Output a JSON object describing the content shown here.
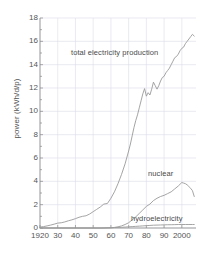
{
  "chart_data": {
    "type": "line",
    "title": "",
    "xlabel": "",
    "ylabel": "power (kWh/d/p)",
    "xlim": [
      1920,
      2008
    ],
    "ylim": [
      0,
      18
    ],
    "grid": true,
    "legend_position": "inline-annotations",
    "xticks": [
      {
        "value": 1920,
        "label": "1920"
      },
      {
        "value": 1930,
        "label": "30"
      },
      {
        "value": 1940,
        "label": "40"
      },
      {
        "value": 1950,
        "label": "50"
      },
      {
        "value": 1960,
        "label": "60"
      },
      {
        "value": 1970,
        "label": "70"
      },
      {
        "value": 1980,
        "label": "80"
      },
      {
        "value": 1990,
        "label": "90"
      },
      {
        "value": 2000,
        "label": "2000"
      }
    ],
    "yticks": [
      {
        "value": 0,
        "label": "0"
      },
      {
        "value": 2,
        "label": "2"
      },
      {
        "value": 4,
        "label": "4"
      },
      {
        "value": 6,
        "label": "6"
      },
      {
        "value": 8,
        "label": "8"
      },
      {
        "value": 10,
        "label": "10"
      },
      {
        "value": 12,
        "label": "12"
      },
      {
        "value": 14,
        "label": "14"
      },
      {
        "value": 16,
        "label": "16"
      },
      {
        "value": 18,
        "label": "18"
      }
    ],
    "line_color": "#9a9a9a",
    "grid_color": "#dcdcea",
    "axis_color": "#8a8a8a",
    "annotations": [
      {
        "name": "total electricity production",
        "text": "total electricity production",
        "x": 1962,
        "y": 15.0
      },
      {
        "name": "nuclear",
        "text": "nuclear",
        "x": 1988,
        "y": 4.6
      },
      {
        "name": "hydroelectricity",
        "text": "hydroelectricity",
        "x": 1986,
        "y": 0.75
      }
    ],
    "series": [
      {
        "name": "total electricity production",
        "x": [
          1920,
          1922,
          1924,
          1926,
          1928,
          1930,
          1932,
          1934,
          1936,
          1938,
          1940,
          1942,
          1944,
          1946,
          1948,
          1950,
          1952,
          1954,
          1956,
          1958,
          1960,
          1962,
          1964,
          1966,
          1968,
          1970,
          1971,
          1972,
          1973,
          1974,
          1975,
          1976,
          1977,
          1978,
          1979,
          1980,
          1981,
          1982,
          1983,
          1984,
          1985,
          1986,
          1987,
          1988,
          1989,
          1990,
          1991,
          1992,
          1993,
          1994,
          1995,
          1996,
          1997,
          1998,
          1999,
          2000,
          2001,
          2002,
          2003,
          2004,
          2005,
          2006,
          2007
        ],
        "values": [
          0.08,
          0.12,
          0.18,
          0.25,
          0.33,
          0.42,
          0.45,
          0.52,
          0.62,
          0.7,
          0.8,
          0.92,
          1.0,
          1.05,
          1.2,
          1.4,
          1.6,
          1.8,
          2.05,
          2.1,
          2.55,
          3.1,
          3.8,
          4.6,
          5.5,
          6.6,
          7.2,
          7.9,
          8.6,
          9.2,
          9.7,
          10.3,
          10.9,
          11.5,
          11.95,
          11.3,
          11.6,
          11.4,
          11.9,
          12.5,
          12.2,
          11.9,
          12.2,
          12.6,
          12.9,
          13.0,
          13.3,
          13.5,
          13.7,
          14.0,
          14.3,
          14.6,
          14.7,
          14.9,
          15.2,
          15.4,
          15.5,
          15.8,
          16.0,
          16.2,
          16.4,
          16.6,
          16.45
        ]
      },
      {
        "name": "nuclear",
        "x": [
          1920,
          1950,
          1955,
          1960,
          1962,
          1964,
          1966,
          1968,
          1970,
          1972,
          1974,
          1976,
          1978,
          1980,
          1982,
          1984,
          1986,
          1988,
          1990,
          1992,
          1994,
          1996,
          1998,
          2000,
          2001,
          2002,
          2003,
          2004,
          2005,
          2006,
          2007
        ],
        "values": [
          0.0,
          0.0,
          0.0,
          0.02,
          0.05,
          0.1,
          0.18,
          0.3,
          0.45,
          0.7,
          0.95,
          1.25,
          1.55,
          1.85,
          2.05,
          2.35,
          2.55,
          2.7,
          2.8,
          2.95,
          3.1,
          3.35,
          3.6,
          3.9,
          3.85,
          3.8,
          3.7,
          3.55,
          3.4,
          3.2,
          2.7
        ]
      },
      {
        "name": "hydroelectricity",
        "x": [
          1920,
          1930,
          1940,
          1950,
          1955,
          1960,
          1962,
          1964,
          1966,
          1968,
          1970,
          1972,
          1974,
          1976,
          1978,
          1980,
          1982,
          1984,
          1986,
          1988,
          1990,
          1992,
          1994,
          1996,
          1998,
          2000,
          2002,
          2004,
          2006,
          2007
        ],
        "values": [
          0.0,
          0.0,
          0.0,
          0.0,
          0.0,
          0.02,
          0.04,
          0.05,
          0.06,
          0.08,
          0.1,
          0.12,
          0.14,
          0.16,
          0.18,
          0.2,
          0.22,
          0.24,
          0.25,
          0.26,
          0.27,
          0.28,
          0.28,
          0.29,
          0.3,
          0.3,
          0.3,
          0.3,
          0.3,
          0.3
        ]
      }
    ]
  }
}
